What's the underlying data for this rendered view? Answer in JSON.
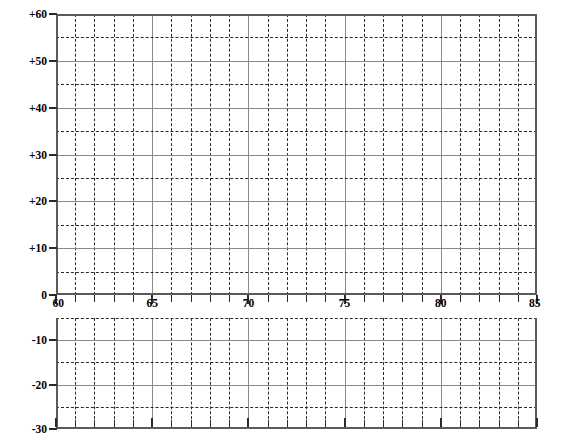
{
  "chart_data": {
    "type": "line",
    "title": "",
    "subtitle": "",
    "xlabel": "",
    "ylabel": "",
    "series": [],
    "x": [],
    "xlim": [
      60,
      85
    ],
    "x_ticks": [
      60,
      65,
      70,
      75,
      80,
      85
    ],
    "x_tick_labels": [
      "60",
      "65",
      "70",
      "75",
      "80",
      "85"
    ],
    "x_minor_step": 1,
    "x_major_step": 5,
    "panels": [
      {
        "name": "upper-panel",
        "ylim": [
          0,
          60
        ],
        "y_ticks": [
          0,
          10,
          20,
          30,
          40,
          50,
          60
        ],
        "y_tick_labels": [
          "0",
          "+10",
          "+20",
          "+30",
          "+40",
          "+50",
          "+60"
        ],
        "y_minor_step": 5
      },
      {
        "name": "lower-panel",
        "ylim": [
          -30,
          -5
        ],
        "y_ticks": [
          -10,
          -20,
          -30
        ],
        "y_tick_labels": [
          "-10",
          "-20",
          "-30"
        ],
        "y_minor_step": 5
      }
    ],
    "grid": true,
    "legend": null,
    "colors": {
      "background": "#ffffff",
      "minor_grid": "#2b2b2b",
      "major_grid": "#8a8a8a",
      "axis": "#5a5a5a",
      "text": "#000000"
    }
  },
  "axes": {
    "upper": {
      "labels": [
        {
          "value": 60,
          "text": "+60"
        },
        {
          "value": 55,
          "text": ""
        },
        {
          "value": 50,
          "text": "+50"
        },
        {
          "value": 45,
          "text": ""
        },
        {
          "value": 40,
          "text": "+40"
        },
        {
          "value": 35,
          "text": ""
        },
        {
          "value": 30,
          "text": "+30"
        },
        {
          "value": 25,
          "text": ""
        },
        {
          "value": 20,
          "text": "+20"
        },
        {
          "value": 15,
          "text": ""
        },
        {
          "value": 10,
          "text": "+10"
        },
        {
          "value": 5,
          "text": ""
        },
        {
          "value": 0,
          "text": "0"
        }
      ]
    },
    "lower": {
      "labels": [
        {
          "value": -10,
          "text": "-10"
        },
        {
          "value": -20,
          "text": "-20"
        },
        {
          "value": -30,
          "text": "-30"
        }
      ]
    },
    "x": {
      "labels": [
        {
          "value": 60,
          "text": "60"
        },
        {
          "value": 65,
          "text": "65"
        },
        {
          "value": 70,
          "text": "70"
        },
        {
          "value": 75,
          "text": "75"
        },
        {
          "value": 80,
          "text": "80"
        },
        {
          "value": 85,
          "text": "85"
        }
      ]
    }
  }
}
